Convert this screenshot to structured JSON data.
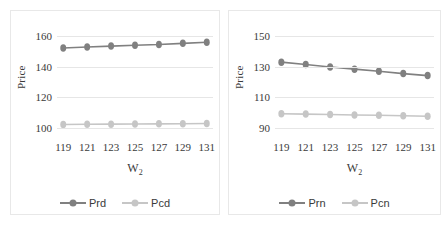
{
  "figure": {
    "background": "#ffffff",
    "caption_fragment": ""
  },
  "colors": {
    "dark_series": "#808080",
    "light_series": "#c6c6c6",
    "gridline": "#e6e6e6",
    "panel_border": "#e8e8e8",
    "text": "#3a3a3a"
  },
  "chart_data": [
    {
      "id": "left",
      "type": "line",
      "title": "",
      "xlabel": "W2",
      "xlabel_base": "W",
      "xlabel_sub": "2",
      "ylabel": "Price",
      "categories": [
        119,
        121,
        123,
        125,
        127,
        129,
        131
      ],
      "xticklabels": [
        "119",
        "121",
        "123",
        "125",
        "127",
        "129",
        "131"
      ],
      "yticks": [
        100,
        120,
        140,
        160
      ],
      "yticklabels": [
        "100",
        "120",
        "140",
        "160"
      ],
      "ylim": [
        94,
        166
      ],
      "grid": true,
      "legend_position": "bottom",
      "series": [
        {
          "name": "Prd",
          "color": "#808080",
          "marker": "circle",
          "values": [
            152.3,
            152.9,
            153.5,
            154.1,
            154.5,
            155.3,
            156.0
          ]
        },
        {
          "name": "Pcd",
          "color": "#c6c6c6",
          "marker": "circle",
          "values": [
            102.2,
            102.3,
            102.4,
            102.5,
            102.6,
            102.7,
            102.8
          ]
        }
      ]
    },
    {
      "id": "right",
      "type": "line",
      "title": "",
      "xlabel": "W2",
      "xlabel_base": "W",
      "xlabel_sub": "2",
      "ylabel": "Price",
      "categories": [
        119,
        121,
        123,
        125,
        127,
        129,
        131
      ],
      "xticklabels": [
        "119",
        "121",
        "123",
        "125",
        "127",
        "129",
        "131"
      ],
      "yticks": [
        90,
        110,
        130,
        150
      ],
      "yticklabels": [
        "90",
        "110",
        "130",
        "150"
      ],
      "ylim": [
        84,
        156
      ],
      "grid": true,
      "legend_position": "bottom",
      "series": [
        {
          "name": "Prn",
          "color": "#808080",
          "marker": "circle",
          "values": [
            133.0,
            131.5,
            129.8,
            128.4,
            127.0,
            125.5,
            124.2
          ]
        },
        {
          "name": "Pcn",
          "color": "#c6c6c6",
          "marker": "circle",
          "values": [
            99.2,
            99.0,
            98.7,
            98.4,
            98.2,
            97.9,
            97.6
          ]
        }
      ]
    }
  ]
}
